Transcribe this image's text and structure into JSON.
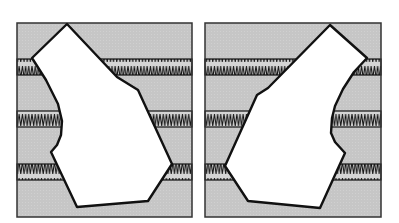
{
  "figure": {
    "colors": {
      "background": "#ffffff",
      "panel_fill": "#c8c8c8",
      "band_fill": "#d4d4d4",
      "stroke": "#111111",
      "shape_fill": "#ffffff"
    },
    "panels": [
      {
        "id": "left",
        "box": {
          "x": 17,
          "y": 23,
          "w": 175,
          "h": 194
        },
        "bands": [
          {
            "y": 59,
            "h": 16
          },
          {
            "y": 111,
            "h": 16
          },
          {
            "y": 164,
            "h": 16
          }
        ],
        "polygon": "67,24 32,58 46,80 58,104 62,121 61,135 57,145 51,152 77,207 148,201 172,164 138,90 117,77"
      },
      {
        "id": "right",
        "box": {
          "x": 205,
          "y": 23,
          "w": 176,
          "h": 194
        },
        "bands": [
          {
            "y": 59,
            "h": 16
          },
          {
            "y": 111,
            "h": 16
          },
          {
            "y": 164,
            "h": 16
          }
        ],
        "polygon": "330,25 367,58 354,72 343,89 335,106 332,118 331,133 335,142 345,153 320,208 248,201 225,166 257,95 268,88"
      }
    ]
  }
}
